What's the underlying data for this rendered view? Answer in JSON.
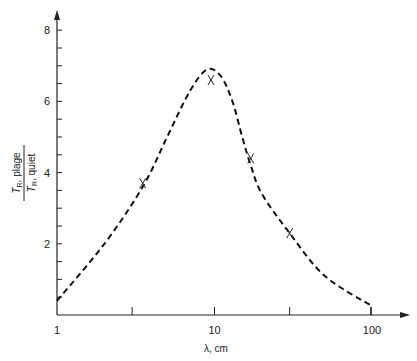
{
  "chart_data": {
    "type": "line",
    "title": "",
    "xlabel": "λ, cm",
    "ylabel_numerator": "T_R, plage",
    "ylabel_denominator": "T_R, quiet",
    "xscale": "log",
    "xlim": [
      1,
      100
    ],
    "ylim": [
      0,
      8
    ],
    "x_ticks": [
      1,
      10,
      100
    ],
    "x_tick_labels": [
      "1",
      "10",
      "100"
    ],
    "x_minor_ticks": [
      3,
      30
    ],
    "y_ticks": [
      2,
      4,
      6,
      8
    ],
    "y_tick_labels": [
      "2",
      "4",
      "6",
      "8"
    ],
    "grid": false,
    "series": [
      {
        "name": "model curve",
        "style": "dashed",
        "x": [
          1,
          2,
          3.5,
          5,
          7,
          9,
          11,
          13,
          15,
          17,
          20,
          30,
          50,
          100
        ],
        "y": [
          0.4,
          2.0,
          3.6,
          5.0,
          6.3,
          6.9,
          6.7,
          6.0,
          5.0,
          4.2,
          3.4,
          2.3,
          1.1,
          0.25
        ]
      },
      {
        "name": "observations",
        "style": "marker-x",
        "x": [
          3.5,
          9.5,
          17,
          30
        ],
        "y": [
          3.7,
          6.6,
          4.4,
          2.3
        ]
      }
    ]
  },
  "labels": {
    "x_axis_title": "λ, cm",
    "y_num": "plage",
    "y_den": "quiet"
  }
}
